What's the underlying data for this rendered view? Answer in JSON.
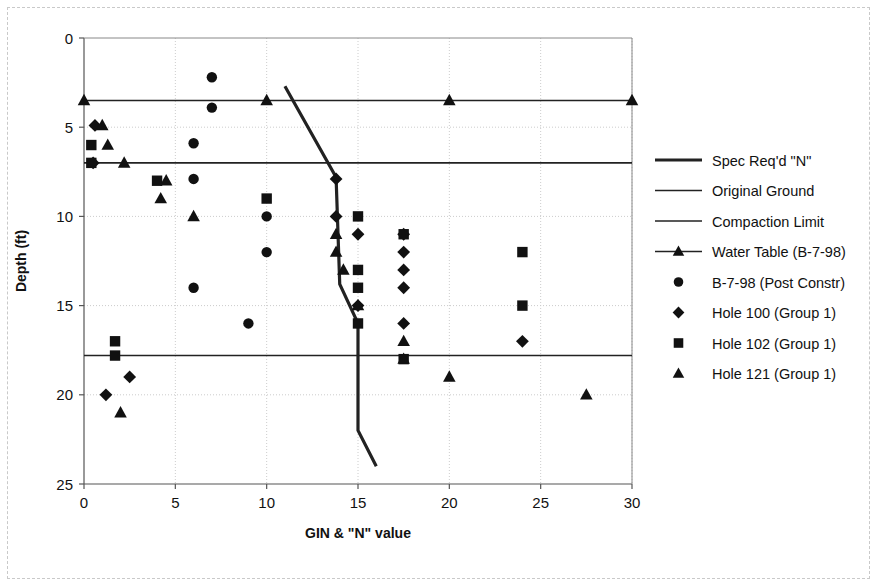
{
  "chart_data": {
    "type": "scatter",
    "title": "",
    "xlabel": "GIN & \"N\" value",
    "ylabel": "Depth (ft)",
    "xlim": [
      0,
      30
    ],
    "ylim": [
      0,
      25
    ],
    "y_inverted": true,
    "xticks": [
      0,
      5,
      10,
      15,
      20,
      25,
      30
    ],
    "yticks": [
      0,
      5,
      10,
      15,
      20,
      25
    ],
    "grid": true,
    "legend_position": "right",
    "series": [
      {
        "name": "Spec Req'd \"N\"",
        "marker": "none",
        "style": "thick-line",
        "points": [
          {
            "x": 11.0,
            "y": 2.7
          },
          {
            "x": 13.8,
            "y": 7.8
          },
          {
            "x": 14.0,
            "y": 13.8
          },
          {
            "x": 15.0,
            "y": 16.0
          },
          {
            "x": 15.0,
            "y": 22.0
          },
          {
            "x": 16.0,
            "y": 24.0
          }
        ]
      },
      {
        "name": "Original Ground",
        "marker": "none",
        "style": "thin-line",
        "points": [
          {
            "x": 0,
            "y": 7.0
          },
          {
            "x": 30,
            "y": 7.0
          }
        ]
      },
      {
        "name": "Compaction Limit",
        "marker": "none",
        "style": "thin-line",
        "points": [
          {
            "x": 0,
            "y": 17.8
          },
          {
            "x": 30,
            "y": 17.8
          }
        ]
      },
      {
        "name": "Water Table (B-7-98)",
        "marker": "triangle",
        "style": "line-with-markers",
        "points": [
          {
            "x": 0,
            "y": 3.5
          },
          {
            "x": 10,
            "y": 3.5
          },
          {
            "x": 20,
            "y": 3.5
          },
          {
            "x": 30,
            "y": 3.5
          }
        ]
      },
      {
        "name": "B-7-98 (Post Constr)",
        "marker": "circle",
        "style": "markers",
        "points": [
          {
            "x": 7.0,
            "y": 2.2
          },
          {
            "x": 7.0,
            "y": 3.9
          },
          {
            "x": 6.0,
            "y": 5.9
          },
          {
            "x": 6.0,
            "y": 7.9
          },
          {
            "x": 10.0,
            "y": 10.0
          },
          {
            "x": 10.0,
            "y": 12.0
          },
          {
            "x": 6.0,
            "y": 14.0
          },
          {
            "x": 9.0,
            "y": 16.0
          }
        ]
      },
      {
        "name": "Hole 100 (Group 1)",
        "marker": "diamond",
        "style": "markers",
        "points": [
          {
            "x": 0.6,
            "y": 4.9
          },
          {
            "x": 0.5,
            "y": 7.0
          },
          {
            "x": 13.8,
            "y": 7.9
          },
          {
            "x": 13.8,
            "y": 10.0
          },
          {
            "x": 15.0,
            "y": 11.0
          },
          {
            "x": 17.5,
            "y": 11.0
          },
          {
            "x": 17.5,
            "y": 12.0
          },
          {
            "x": 17.5,
            "y": 13.0
          },
          {
            "x": 17.5,
            "y": 14.0
          },
          {
            "x": 15.0,
            "y": 15.0
          },
          {
            "x": 17.5,
            "y": 16.0
          },
          {
            "x": 24.0,
            "y": 17.0
          },
          {
            "x": 2.5,
            "y": 19.0
          },
          {
            "x": 1.2,
            "y": 20.0
          }
        ]
      },
      {
        "name": "Hole 102 (Group 1)",
        "marker": "square",
        "style": "markers",
        "points": [
          {
            "x": 0.4,
            "y": 6.0
          },
          {
            "x": 0.4,
            "y": 7.0
          },
          {
            "x": 4.0,
            "y": 8.0
          },
          {
            "x": 10.0,
            "y": 9.0
          },
          {
            "x": 15.0,
            "y": 10.0
          },
          {
            "x": 17.5,
            "y": 11.0
          },
          {
            "x": 24.0,
            "y": 12.0
          },
          {
            "x": 15.0,
            "y": 13.0
          },
          {
            "x": 15.0,
            "y": 14.0
          },
          {
            "x": 24.0,
            "y": 15.0
          },
          {
            "x": 15.0,
            "y": 16.0
          },
          {
            "x": 1.7,
            "y": 17.0
          },
          {
            "x": 1.7,
            "y": 17.8
          },
          {
            "x": 17.5,
            "y": 18.0
          }
        ]
      },
      {
        "name": "Hole 121 (Group 1)",
        "marker": "triangle",
        "style": "markers",
        "points": [
          {
            "x": 1.0,
            "y": 4.9
          },
          {
            "x": 1.3,
            "y": 6.0
          },
          {
            "x": 2.2,
            "y": 7.0
          },
          {
            "x": 4.5,
            "y": 8.0
          },
          {
            "x": 4.2,
            "y": 9.0
          },
          {
            "x": 6.0,
            "y": 10.0
          },
          {
            "x": 13.8,
            "y": 11.0
          },
          {
            "x": 13.8,
            "y": 12.0
          },
          {
            "x": 14.2,
            "y": 13.0
          },
          {
            "x": 15.0,
            "y": 15.0
          },
          {
            "x": 17.5,
            "y": 17.0
          },
          {
            "x": 17.5,
            "y": 18.0
          },
          {
            "x": 20.0,
            "y": 19.0
          },
          {
            "x": 2.0,
            "y": 21.0
          },
          {
            "x": 27.5,
            "y": 20.0
          }
        ]
      }
    ]
  },
  "legend": {
    "items": [
      {
        "label": "Spec Req'd \"N\"",
        "marker": "none",
        "style": "thick-line"
      },
      {
        "label": "Original Ground",
        "marker": "none",
        "style": "thin-line"
      },
      {
        "label": "Compaction Limit",
        "marker": "none",
        "style": "thin-line"
      },
      {
        "label": "Water Table (B-7-98)",
        "marker": "triangle",
        "style": "line-with-markers"
      },
      {
        "label": "B-7-98 (Post Constr)",
        "marker": "circle",
        "style": "markers"
      },
      {
        "label": "Hole 100 (Group 1)",
        "marker": "diamond",
        "style": "markers"
      },
      {
        "label": "Hole 102 (Group 1)",
        "marker": "square",
        "style": "markers"
      },
      {
        "label": "Hole 121 (Group 1)",
        "marker": "triangle",
        "style": "markers"
      }
    ]
  },
  "colors": {
    "marker": "#111111",
    "line": "#222222",
    "grid": "#cccccc",
    "axis": "#444444",
    "background": "#ffffff",
    "frame": "#c9c9c9"
  }
}
